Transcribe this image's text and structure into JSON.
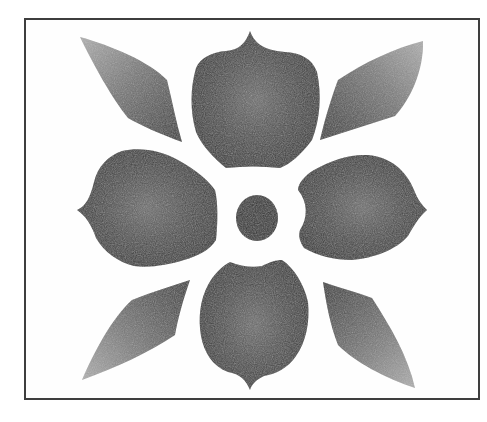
{
  "image": {
    "subject": "stencil-style four-petal flower with four leaves",
    "background": "#ffffff",
    "frame_color": "#3e3e3e",
    "petal_dark": "#3a3a3a",
    "petal_light": "#6e6e6e",
    "leaf_dark": "#3c3c3c",
    "leaf_light": "#a8a8a8",
    "center_color": "#2e2e2e"
  },
  "elements": {
    "petals": [
      "top",
      "right",
      "bottom",
      "left"
    ],
    "leaves": [
      "top-left",
      "top-right",
      "bottom-left",
      "bottom-right"
    ],
    "center": "round dot"
  }
}
